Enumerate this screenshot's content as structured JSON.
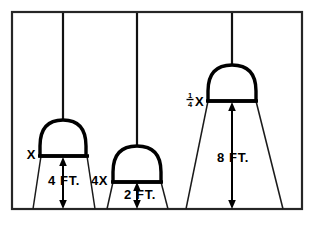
{
  "figure": {
    "background_color": "#ffffff",
    "line_color": "#000000",
    "frame": {
      "name": "diagram-border",
      "x": 11,
      "y": 11,
      "width": 292,
      "height": 199
    },
    "lamps": [
      {
        "id": "lamp-1",
        "brightness_label": "X",
        "height_label": "4 FT.",
        "cord_x": 63,
        "cord_top": 12,
        "shade_base_y": 156,
        "shade_left": 40,
        "shade_right": 88,
        "shade_top": 119,
        "cone_floor_left": 33,
        "cone_floor_right": 95,
        "floor_y": 209
      },
      {
        "id": "lamp-2",
        "brightness_label": "4X",
        "height_label": "2 FT.",
        "cord_x": 137,
        "cord_top": 12,
        "shade_base_y": 182,
        "shade_left": 112,
        "shade_right": 163,
        "shade_top": 145,
        "cone_floor_left": 107,
        "cone_floor_right": 168,
        "floor_y": 209
      },
      {
        "id": "lamp-3",
        "brightness_numerator": "1",
        "brightness_denominator": "4",
        "brightness_label": "X",
        "height_label": "8 FT.",
        "cord_x": 232,
        "cord_top": 12,
        "shade_base_y": 101,
        "shade_left": 207,
        "shade_right": 258,
        "shade_top": 64,
        "cone_floor_left": 186,
        "cone_floor_right": 283,
        "floor_y": 209
      }
    ]
  }
}
